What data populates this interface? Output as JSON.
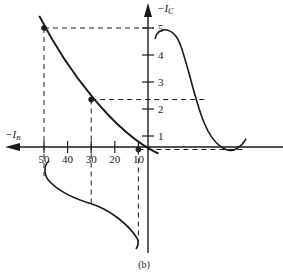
{
  "figure": {
    "caption": "(b)",
    "y_axis_label": "−I",
    "y_axis_sub": "C",
    "x_axis_label": "−I",
    "x_axis_sub": "B",
    "colors": {
      "ink": "#1a1a1a",
      "background": "#ffffff"
    }
  },
  "chart_data": {
    "type": "line",
    "title": "",
    "caption": "(b)",
    "xlabel": "-I_B",
    "ylabel": "-I_C",
    "x_ticks": [
      "50",
      "40",
      "30",
      "20",
      "10"
    ],
    "y_ticks": [
      "5",
      "4",
      "3",
      "2",
      "1"
    ],
    "xlim": [
      0,
      54
    ],
    "ylim": [
      0,
      5.5
    ],
    "transfer_curve": {
      "name": "I_C vs I_B transfer characteristic",
      "points": [
        {
          "ib": 52,
          "ic": 5.4
        },
        {
          "ib": 50,
          "ic": 5.0
        },
        {
          "ib": 40,
          "ic": 3.6
        },
        {
          "ib": 30,
          "ic": 2.35
        },
        {
          "ib": 20,
          "ic": 1.3
        },
        {
          "ib": 10,
          "ic": 0.5
        },
        {
          "ib": 5,
          "ic": 0.3
        }
      ],
      "marked_points": [
        {
          "ib": 50,
          "ic": 5.0
        },
        {
          "ib": 30,
          "ic": 2.35
        },
        {
          "ib": 10,
          "ic": 0.5
        }
      ]
    },
    "output_waveform": {
      "name": "collector current waveform",
      "range_ic": [
        0.5,
        5.0
      ]
    },
    "input_waveform": {
      "name": "base current waveform",
      "range_ib": [
        10,
        50
      ]
    },
    "grid": false
  }
}
